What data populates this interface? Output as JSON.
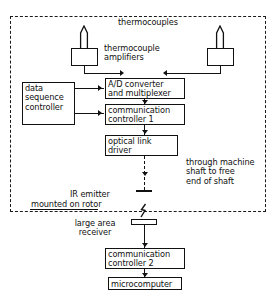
{
  "diagram": {
    "boundary_label": "rotating machine boundary (dashed)"
  },
  "labels": {
    "thermocouples": "thermocouples",
    "thermocouple_amplifiers": "thermocouple\namplifiers",
    "through_shaft": "through machine\nshaft to free\nend of shaft",
    "ir_emitter": "IR emitter",
    "mounted_on_rotor": "mounted on rotor",
    "large_area_receiver": "large area\nreceiver"
  },
  "blocks": {
    "data_sequence_controller": "data\nsequence\ncontroller",
    "ad_converter": "A/D converter\nand multiplexer",
    "communication_controller_1": "communication\ncontroller 1",
    "optical_link_driver": "optical link\ndriver",
    "communication_controller_2": "communication\ncontroller 2",
    "microcomputer": "microcomputer"
  },
  "colors": {
    "line": "#111111",
    "background": "#ffffff"
  }
}
